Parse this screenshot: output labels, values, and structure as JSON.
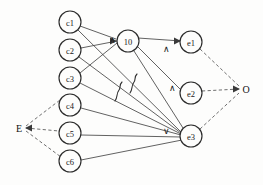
{
  "diagram": {
    "background_color": "#fdfdfc",
    "stroke_color": "#3a3a3a",
    "node_fill": "#fdfdfc",
    "width": 263,
    "height": 185,
    "cause_nodes": [
      {
        "id": "c1",
        "label": "c1",
        "cx": 70,
        "cy": 22,
        "r": 11
      },
      {
        "id": "c2",
        "label": "c2",
        "cx": 70,
        "cy": 50,
        "r": 11
      },
      {
        "id": "c3",
        "label": "c3",
        "cx": 70,
        "cy": 78,
        "r": 11
      },
      {
        "id": "c4",
        "label": "c4",
        "cx": 70,
        "cy": 105,
        "r": 11
      },
      {
        "id": "c5",
        "label": "c5",
        "cx": 70,
        "cy": 133,
        "r": 11
      },
      {
        "id": "c6",
        "label": "c6",
        "cx": 70,
        "cy": 161,
        "r": 11
      }
    ],
    "middle_nodes": [
      {
        "id": "n10",
        "label": "10",
        "cx": 128,
        "cy": 41,
        "r": 11
      }
    ],
    "effect_nodes": [
      {
        "id": "e1",
        "label": "e1",
        "cx": 191,
        "cy": 42,
        "r": 11
      },
      {
        "id": "e2",
        "label": "e2",
        "cx": 191,
        "cy": 93,
        "r": 11
      },
      {
        "id": "e3",
        "label": "e3",
        "cx": 191,
        "cy": 136,
        "r": 11
      }
    ],
    "terminals": [
      {
        "id": "E",
        "label": "E",
        "x": 19,
        "y": 128
      },
      {
        "id": "O",
        "label": "O",
        "x": 246,
        "y": 89
      }
    ],
    "gate_marks": [
      {
        "id": "gate-10",
        "symbol": "∧",
        "x": 112,
        "y": 40,
        "for_node": "10"
      },
      {
        "id": "gate-e1",
        "symbol": "∧",
        "x": 166,
        "y": 49,
        "for_node": "e1"
      },
      {
        "id": "gate-e2",
        "symbol": "∧",
        "x": 172,
        "y": 88,
        "for_node": "e2"
      },
      {
        "id": "gate-e3",
        "symbol": "∨",
        "x": 166,
        "y": 131,
        "for_node": "e3"
      }
    ],
    "solid_edges": [
      {
        "id": "c1-n10",
        "from": "c1",
        "to": "n10"
      },
      {
        "id": "c2-n10",
        "from": "c2",
        "to": "n10"
      },
      {
        "id": "c3-n10",
        "from": "c3",
        "to": "n10"
      },
      {
        "id": "c1-e3",
        "from": "c1",
        "to": "e3"
      },
      {
        "id": "c2-e3",
        "from": "c2",
        "to": "e3"
      },
      {
        "id": "c3-e3",
        "from": "c3",
        "to": "e3"
      },
      {
        "id": "c4-e3",
        "from": "c4",
        "to": "e3"
      },
      {
        "id": "c5-e3",
        "from": "c5",
        "to": "e3"
      },
      {
        "id": "c6-e3",
        "from": "c6",
        "to": "e3"
      },
      {
        "id": "n10-e1",
        "from": "n10",
        "to": "e1"
      },
      {
        "id": "n10-e2",
        "from": "n10",
        "to": "e2"
      },
      {
        "id": "n10-e3",
        "from": "n10",
        "to": "e3"
      }
    ],
    "dashed_edges": [
      {
        "id": "E-c4",
        "from": "E",
        "to": "c4"
      },
      {
        "id": "E-c5",
        "from": "E",
        "to": "c5"
      },
      {
        "id": "E-c6",
        "from": "E",
        "to": "c6"
      },
      {
        "id": "e1-O",
        "from": "e1",
        "to": "O"
      },
      {
        "id": "e2-O",
        "from": "e2",
        "to": "O"
      },
      {
        "id": "e3-O",
        "from": "e3",
        "to": "O"
      }
    ],
    "squiggle_marks": [
      {
        "id": "squiggle-1",
        "x": 120,
        "y": 95
      },
      {
        "id": "squiggle-2",
        "x": 134,
        "y": 85
      }
    ]
  }
}
